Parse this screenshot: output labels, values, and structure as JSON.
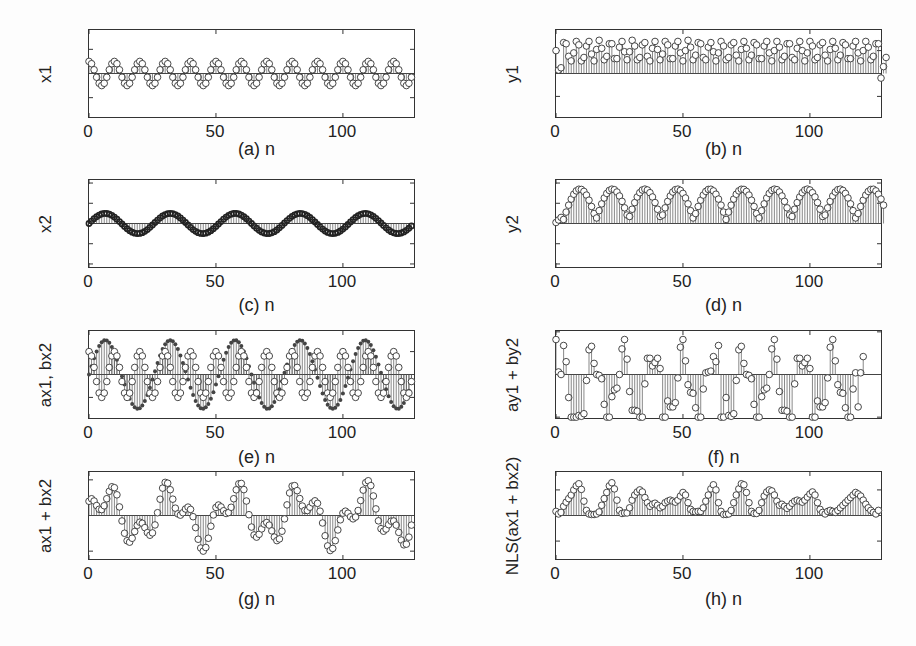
{
  "figure": {
    "panels": [
      {
        "id": "a",
        "caption": "(a) n",
        "ylabel": "x1",
        "ylim": [
          -3.6,
          3.6
        ],
        "yticks": [
          2,
          0,
          -2
        ],
        "ytick_labels": [
          "2",
          "0",
          "−2"
        ]
      },
      {
        "id": "b",
        "caption": "(b) n",
        "ylabel": "y1",
        "ylim": [
          -3.8,
          3.8
        ],
        "yticks": [
          2,
          0,
          -2
        ],
        "ytick_labels": [
          "2",
          "0",
          "−2"
        ]
      },
      {
        "id": "c",
        "caption": "(c) n",
        "ylabel": "x2",
        "ylim": [
          -4.3,
          4.3
        ],
        "yticks": [
          4,
          2,
          0,
          -2,
          -4
        ],
        "ytick_labels": [
          "4",
          "2",
          "0",
          "−2",
          "−4"
        ]
      },
      {
        "id": "d",
        "caption": "(d) n",
        "ylabel": "y2",
        "ylim": [
          -4.3,
          4.3
        ],
        "yticks": [
          4,
          2,
          0,
          -2,
          -4
        ],
        "ytick_labels": [
          "4",
          "2",
          "0",
          "−2",
          "−4"
        ]
      },
      {
        "id": "e",
        "caption": "(e) n",
        "ylabel": "ax1, bx2",
        "ylim": [
          -3.8,
          3.8
        ],
        "yticks": [
          2,
          0,
          -2
        ],
        "ytick_labels": [
          "2",
          "0",
          "−2"
        ]
      },
      {
        "id": "f",
        "caption": "(f) n",
        "ylabel": "ay1 + by2",
        "ylim": [
          -5.1,
          5.1
        ],
        "yticks": [
          5,
          0,
          -5
        ],
        "ytick_labels": [
          "5",
          "0",
          "−5"
        ]
      },
      {
        "id": "g",
        "caption": "(g) n",
        "ylabel": "ax1 + bx2",
        "ylim": [
          -6.1,
          6.1
        ],
        "yticks": [
          5,
          0,
          -5
        ],
        "ytick_labels": [
          "5",
          "0",
          "−5"
        ]
      },
      {
        "id": "h",
        "caption": "(h) n",
        "ylabel": "NLS(ax1 + bx2)",
        "ylim": [
          -85,
          85
        ],
        "yticks": [
          50,
          0,
          -50
        ],
        "ytick_labels": [
          "50",
          "0",
          "−50"
        ]
      }
    ],
    "xticks": [
      0,
      50,
      100
    ],
    "xtick_labels": [
      "0",
      "50",
      "100"
    ],
    "xlim": [
      0,
      128
    ]
  },
  "chart_data": [
    {
      "type": "stem",
      "title": "",
      "xlabel": "(a) n",
      "ylabel": "x1",
      "xlim": [
        0,
        128
      ],
      "ylim": [
        -3.6,
        3.6
      ],
      "description": "cosine, period 10 samples, amplitude 1",
      "formula": "cos(2*pi*n/10)",
      "n_points": 128
    },
    {
      "type": "stem",
      "title": "",
      "xlabel": "(b) n",
      "ylabel": "y1",
      "xlim": [
        0,
        128
      ],
      "ylim": [
        -3.8,
        3.8
      ],
      "description": "positive values mostly between 1 and 2.7; starts at 2, dips to ~0.3, ends with ~ -0.4 then 1.4",
      "n_points": 130
    },
    {
      "type": "stem",
      "title": "",
      "xlabel": "(c) n",
      "ylabel": "x2",
      "xlim": [
        0,
        128
      ],
      "ylim": [
        -4.3,
        4.3
      ],
      "description": "sine, 5 periods over 128 samples, amplitude 1, dense markers",
      "formula": "sin(2*pi*n/25.6)",
      "n_points": 128
    },
    {
      "type": "stem",
      "title": "",
      "xlabel": "(d) n",
      "ylabel": "y2",
      "xlim": [
        0,
        128
      ],
      "ylim": [
        -4.3,
        4.3
      ],
      "description": "10 triangular peaks ~3.4, troughs ~0.4, starts near 0",
      "n_points": 130
    },
    {
      "type": "stem",
      "title": "",
      "xlabel": "(e) n",
      "ylabel": "ax1, bx2",
      "xlim": [
        0,
        128
      ],
      "ylim": [
        -3.8,
        3.8
      ],
      "description": "overlay of 2*x1 (open circles) and 3*x2 (filled dots)",
      "series": [
        {
          "name": "ax1",
          "formula": "2*cos(2*pi*n/10)",
          "marker": "open"
        },
        {
          "name": "bx2",
          "formula": "3*sin(2*pi*n/25.6)",
          "marker": "filled"
        }
      ]
    },
    {
      "type": "stem",
      "title": "",
      "xlabel": "(f) n",
      "ylabel": "ay1 + by2",
      "xlim": [
        0,
        130
      ],
      "ylim": [
        -5.1,
        5.1
      ],
      "description": "values in [-5, 4], clipped bars at -5"
    },
    {
      "type": "stem",
      "title": "",
      "xlabel": "(g) n",
      "ylabel": "ax1 + bx2",
      "xlim": [
        0,
        128
      ],
      "ylim": [
        -6.1,
        6.1
      ],
      "description": "sum 2*x1+3*x2, range about -5 to 5",
      "formula": "2*cos(2*pi*n/10)+3*sin(2*pi*n/25.6)"
    },
    {
      "type": "stem",
      "title": "",
      "xlabel": "(h) n",
      "ylabel": "NLS(ax1 + bx2)",
      "xlim": [
        0,
        130
      ],
      "ylim": [
        -85,
        85
      ],
      "description": "non-negative, peaks 45-65, minima near 0"
    }
  ],
  "series": {
    "y1": [
      2.0,
      0.3,
      0.5,
      2.7,
      2.6,
      1.5,
      1.1,
      1.8,
      2.8,
      2.5,
      1.1,
      1.4,
      2.4,
      2.8,
      1.7,
      1.1,
      2.1,
      2.9,
      2.2,
      1.2,
      1.5,
      2.6,
      2.6,
      1.3,
      1.3,
      2.3,
      2.8,
      1.9,
      1.2,
      1.9,
      2.9,
      2.4,
      1.2,
      1.4,
      2.5,
      2.7,
      1.5,
      1.1,
      2.2,
      2.8,
      2.1,
      1.2,
      1.7,
      2.8,
      2.5,
      1.3,
      1.3,
      2.4,
      2.8,
      1.8,
      1.1,
      2.0,
      2.9,
      2.3,
      1.2,
      1.6,
      2.7,
      2.6,
      1.4,
      1.2,
      2.3,
      2.7,
      1.9,
      1.1,
      1.8,
      2.8,
      2.4,
      1.2,
      1.4,
      2.5,
      2.7,
      1.6,
      1.1,
      2.1,
      2.8,
      2.2,
      1.2,
      1.6,
      2.7,
      2.5,
      1.3,
      1.3,
      2.4,
      2.8,
      1.8,
      1.1,
      2.0,
      2.8,
      2.3,
      1.2,
      1.5,
      2.6,
      2.6,
      1.4,
      1.2,
      2.2,
      2.8,
      2.0,
      1.1,
      1.8,
      2.8,
      2.4,
      1.2,
      1.4,
      2.5,
      2.7,
      1.6,
      1.1,
      2.1,
      2.8,
      2.2,
      1.2,
      1.6,
      2.7,
      2.5,
      1.3,
      1.3,
      2.4,
      2.8,
      1.8,
      1.1,
      2.0,
      2.8,
      2.3,
      1.2,
      1.5,
      2.6,
      2.6,
      -0.4,
      0.6,
      1.4
    ],
    "f": [
      4.1,
      0.3,
      0.0,
      3.4,
      1.5,
      -2.7,
      -5.0,
      -5.0,
      -5.0,
      -4.8,
      -4.9,
      -4.6,
      -0.7,
      2.9,
      3.3,
      1.3,
      0.0,
      -0.1,
      -0.5,
      -3.5,
      -5.0,
      -5.0,
      -2.6,
      -1.8,
      -1.6,
      0.0,
      3.0,
      4.1,
      1.8,
      -2.0,
      -4.2,
      -4.2,
      -4.3,
      -5.0,
      -5.0,
      -1.1,
      1.9,
      1.9,
      1.0,
      1.4,
      1.9,
      0.7,
      -5.0,
      -5.0,
      -3.1,
      -3.8,
      -3.8,
      -3.3,
      -0.4,
      3.2,
      4.1,
      1.6,
      -1.2,
      -2.1,
      -2.2,
      -3.9,
      -5.0,
      -5.0,
      -1.7,
      0.2,
      0.3,
      0.4,
      2.1,
      1.5,
      3.4,
      -5.0,
      -5.0,
      -2.7,
      -4.8,
      -4.9,
      -4.6,
      -0.7,
      2.9,
      3.3,
      1.3,
      0.0,
      -0.1,
      -0.5,
      -3.5,
      -5.0,
      -5.0,
      -2.6,
      -1.8,
      -1.6,
      0.0,
      3.0,
      4.1,
      1.8,
      -2.0,
      -4.2,
      -4.2,
      -4.3,
      -5.0,
      -5.0,
      -1.1,
      1.9,
      1.9,
      1.0,
      1.4,
      1.9,
      0.7,
      -5.0,
      -5.0,
      -3.1,
      -3.8,
      -3.8,
      -3.3,
      -0.4,
      3.2,
      4.1,
      1.6,
      -1.2,
      -2.1,
      -2.2,
      -3.9,
      -5.0,
      -5.0,
      -1.7,
      0.2,
      -3.8,
      0.2,
      2.1
    ],
    "h": [
      8,
      3,
      6,
      18,
      26,
      33,
      40,
      50,
      58,
      62,
      51,
      28,
      10,
      3,
      2,
      2,
      3,
      7,
      20,
      33,
      45,
      58,
      64,
      52,
      30,
      10,
      4,
      5,
      5,
      15,
      30,
      40,
      46,
      50,
      46,
      35,
      25,
      18,
      22,
      24,
      20,
      15,
      18,
      25,
      28,
      30,
      28,
      26,
      30,
      38,
      45,
      40,
      25,
      12,
      8,
      7,
      8,
      8,
      15,
      28,
      40,
      52,
      60,
      50,
      25,
      8,
      2,
      2,
      3,
      10,
      25,
      40,
      52,
      62,
      60,
      45,
      25,
      8,
      4,
      4,
      10,
      25,
      38,
      46,
      50,
      48,
      40,
      28,
      20,
      22,
      18,
      14,
      18,
      24,
      28,
      30,
      28,
      26,
      30,
      36,
      42,
      46,
      40,
      25,
      12,
      6,
      3,
      8,
      10,
      8,
      6,
      10,
      15,
      20,
      25,
      30,
      35,
      40,
      45,
      42,
      38,
      30,
      22,
      15,
      10,
      6,
      3,
      10
    ]
  }
}
